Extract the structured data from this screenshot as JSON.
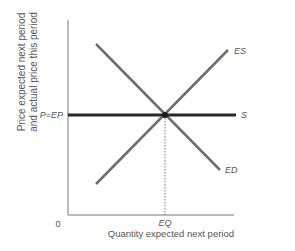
{
  "diagram": {
    "y_axis_label_line1": "Price expected next period",
    "y_axis_label_line2": "and actual price this period",
    "x_axis_label": "Quantity expected next period",
    "origin_label": "0",
    "price_tick_label": "P=EP",
    "quantity_tick_label": "EQ",
    "curves": {
      "expected_supply": "ES",
      "supply": "S",
      "expected_demand": "ED"
    },
    "colors": {
      "axis": "#777777",
      "curve": "#6e6e6e",
      "supply_line": "#2b2b2b",
      "text": "#555555"
    }
  }
}
